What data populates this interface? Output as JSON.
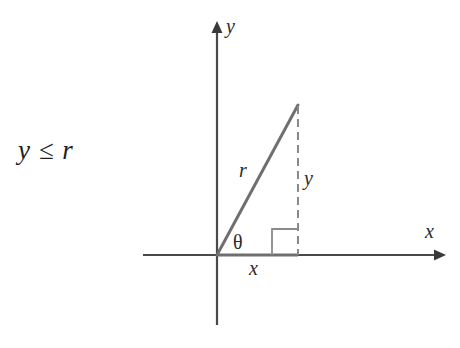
{
  "figure": {
    "background_color": "#ffffff",
    "axis_color": "#4a4a4a",
    "triangle_color": "#6f6f6f",
    "dash_color": "#8a8a8a",
    "text_color": "#1e1e1e",
    "inequality": "y ≤ r",
    "axes": {
      "x_label": "x",
      "y_label": "y",
      "origin": {
        "x": 217,
        "y": 255
      },
      "x_start": {
        "x": 143,
        "y": 255
      },
      "x_end": {
        "x": 445,
        "y": 255
      },
      "y_start": {
        "x": 217,
        "y": 325
      },
      "y_end": {
        "x": 217,
        "y": 22
      }
    },
    "triangle": {
      "vertices": {
        "origin": {
          "x": 217,
          "y": 255
        },
        "apex": {
          "x": 298,
          "y": 105
        },
        "foot": {
          "x": 298,
          "y": 255
        }
      },
      "hypotenuse_label": "r",
      "opposite_label": "y",
      "adjacent_label": "x",
      "angle_label": "θ",
      "right_angle_marker": {
        "x": 272,
        "y": 229,
        "size": 26
      }
    }
  }
}
